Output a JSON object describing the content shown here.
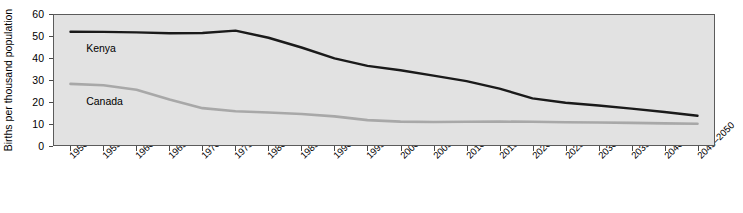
{
  "chart_data": {
    "type": "line",
    "title": "",
    "xlabel": "",
    "ylabel": "Births per thousand population",
    "ylim": [
      0,
      60
    ],
    "yticks": [
      0,
      10,
      20,
      30,
      40,
      50,
      60
    ],
    "grid": false,
    "legend_position": "inline-annotation",
    "categories": [
      "1950–1955",
      "1955–1960",
      "1960–1965",
      "1965–1970",
      "1970–1975",
      "1975–1980",
      "1980–1985",
      "1985–1990",
      "1990–1995",
      "1995–2000",
      "2000–2005",
      "2005–2010",
      "2010–2015",
      "2015–2020",
      "2020–2025",
      "2025–2030",
      "2030–2035",
      "2035–2040",
      "2040–2045",
      "2045–2050"
    ],
    "series": [
      {
        "name": "Kenya",
        "color": "#1a1a1a",
        "values": [
          52.3,
          52.2,
          52.0,
          51.6,
          51.7,
          52.8,
          49.5,
          45.0,
          40.0,
          36.5,
          34.5,
          32.0,
          29.5,
          26.0,
          21.5,
          19.5,
          18.2,
          16.8,
          15.2,
          13.5
        ]
      },
      {
        "name": "Canada",
        "color": "#a8a8a8",
        "values": [
          28.2,
          27.6,
          25.5,
          21.0,
          17.0,
          15.6,
          15.0,
          14.3,
          13.2,
          11.5,
          10.8,
          10.6,
          10.7,
          10.8,
          10.7,
          10.5,
          10.4,
          10.2,
          10.0,
          9.8
        ]
      }
    ],
    "annotations": [
      {
        "text": "Kenya",
        "series": "Kenya"
      },
      {
        "text": "Canada",
        "series": "Canada"
      }
    ]
  },
  "style": {
    "plot_background": "#e2e2e2",
    "page_background": "#ffffff",
    "axis_color": "#5b5b5b",
    "kenya_color": "#1a1a1a",
    "canada_color": "#a8a8a8"
  }
}
